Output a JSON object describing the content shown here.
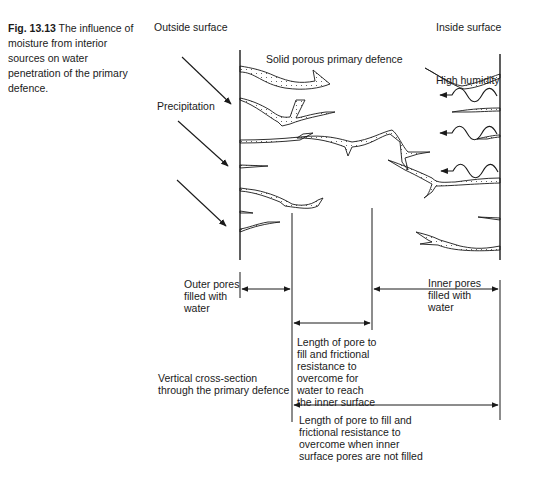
{
  "figure": {
    "number": "Fig. 13.13",
    "caption": "The influence of moisture from interior sources on water penetration of the primary defence."
  },
  "labels": {
    "outside_surface": "Outside surface",
    "inside_surface": "Inside surface",
    "primary_defence": "Solid porous primary defence",
    "high_humidity": "High humidity",
    "precipitation": "Precipitation",
    "outer_pores": "Outer pores\nfilled with\nwater",
    "inner_pores": "Inner pores\nfilled with\nwater",
    "pore_length_filled": "Length of pore to\nfill and frictional\nresistance to\novercome for\nwater to reach\nthe inner surface",
    "cross_section": "Vertical cross-section\nthrough the primary defence",
    "pore_length_unfilled": "Length of pore to fill and\nfrictional resistance to\novercome when inner\nsurface pores are not filled"
  },
  "colors": {
    "ink": "#1a1a1a",
    "background": "#ffffff"
  }
}
